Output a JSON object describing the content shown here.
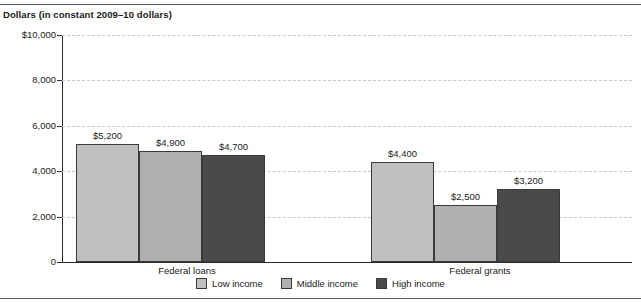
{
  "axis_title": "Dollars (in constant 2009–10 dollars)",
  "colors": {
    "low_income": "#c0c0c0",
    "middle_income": "#b0b0b0",
    "high_income": "#4a4a4a",
    "bar_outline": "#3a3a3a",
    "gridline": "#c9c9c9",
    "axis": "#2b2b2b",
    "rule": "#5c5c5c"
  },
  "legend": {
    "items": [
      {
        "label": "Low income",
        "swatch": "#c0c0c0"
      },
      {
        "label": "Middle income",
        "swatch": "#b0b0b0"
      },
      {
        "label": "High income",
        "swatch": "#4a4a4a"
      }
    ]
  },
  "y_axis": {
    "ticks": [
      "$10,000",
      "8,000",
      "6,000",
      "4,000",
      "2,000",
      "0"
    ],
    "tick_values": [
      10000,
      8000,
      6000,
      4000,
      2000,
      0
    ]
  },
  "chart_data": {
    "type": "bar",
    "title": "",
    "xlabel": "",
    "ylabel": "Dollars (in constant 2009–10 dollars)",
    "ylim": [
      0,
      10000
    ],
    "ytick_labels": [
      "$10,000",
      "8,000",
      "6,000",
      "4,000",
      "2,000",
      "0"
    ],
    "yticks": [
      10000,
      8000,
      6000,
      4000,
      2000,
      0
    ],
    "grid": true,
    "grid_style": "dashed-horizontal",
    "legend_position": "bottom-center",
    "categories": [
      "Federal loans",
      "Federal grants"
    ],
    "series": [
      {
        "name": "Low income",
        "color": "#c0c0c0",
        "values": [
          5200,
          4400
        ],
        "labels": [
          "$5,200",
          "$4,400"
        ]
      },
      {
        "name": "Middle income",
        "color": "#b0b0b0",
        "values": [
          4900,
          2500
        ],
        "labels": [
          "$4,900",
          "$2,500"
        ]
      },
      {
        "name": "High income",
        "color": "#4a4a4a",
        "values": [
          4700,
          3200
        ],
        "labels": [
          "$4,700",
          "$3,200"
        ]
      }
    ]
  },
  "bars": [
    {
      "group": "Federal loans",
      "series": "Low income",
      "value": 5200,
      "label": "$5,200",
      "color": "#c0c0c0",
      "x": 76,
      "width": 63
    },
    {
      "group": "Federal loans",
      "series": "Middle income",
      "value": 4900,
      "label": "$4,900",
      "color": "#b0b0b0",
      "x": 139,
      "width": 63
    },
    {
      "group": "Federal loans",
      "series": "High income",
      "value": 4700,
      "label": "$4,700",
      "color": "#4a4a4a",
      "x": 202,
      "width": 63
    },
    {
      "group": "Federal grants",
      "series": "Low income",
      "value": 4400,
      "label": "$4,400",
      "color": "#c0c0c0",
      "x": 371,
      "width": 63
    },
    {
      "group": "Federal grants",
      "series": "Middle income",
      "value": 2500,
      "label": "$2,500",
      "color": "#b0b0b0",
      "x": 434,
      "width": 63
    },
    {
      "group": "Federal grants",
      "series": "High income",
      "value": 3200,
      "label": "$3,200",
      "color": "#4a4a4a",
      "x": 497,
      "width": 63
    }
  ],
  "group_labels": [
    {
      "text": "Federal loans",
      "center": 187
    },
    {
      "text": "Federal grants",
      "center": 480
    }
  ]
}
